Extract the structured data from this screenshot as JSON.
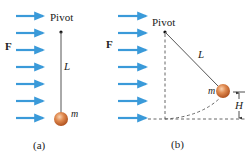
{
  "figure": {
    "colors": {
      "arrow": "#3a9ad9",
      "string": "#555555",
      "ball_light": "#f4b98a",
      "ball_dark": "#c0602a",
      "dashed": "#555555"
    },
    "panel_a": {
      "pivot_label": "Pivot",
      "force_label": "F",
      "length_label": "L",
      "mass_label": "m",
      "caption": "(a)",
      "arrow_count": 7
    },
    "panel_b": {
      "pivot_label": "Pivot",
      "force_label": "F",
      "length_label": "L",
      "mass_label": "m",
      "height_label": "H",
      "caption": "(b)",
      "arrow_count": 7
    }
  }
}
